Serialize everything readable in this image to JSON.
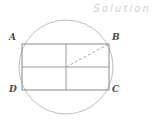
{
  "figure": {
    "watermark": "Solution",
    "canvas": {
      "width": 155,
      "height": 122,
      "background": "#ffffff"
    },
    "colors": {
      "stroke": "#8a8a8a",
      "stroke_light": "#b4b4b4",
      "circle": "#bfbfbf",
      "dashed": "#b0b0b0",
      "label": "#4a4a4a",
      "watermark": "#cfcfcf"
    },
    "circle": {
      "name": "circumscribed-circle",
      "cx": 66,
      "cy": 67,
      "r": 47
    },
    "rectangle": {
      "name": "inscribed-rectangle",
      "x": 22,
      "y": 44,
      "width": 87,
      "height": 46
    },
    "midlines": {
      "vertical_x": 66,
      "horizontal_y": 67
    },
    "diagonal": {
      "name": "center-to-B-radius",
      "style": "dashed",
      "x1": 66,
      "y1": 67,
      "x2": 109,
      "y2": 44
    },
    "vertices": [
      {
        "id": "A",
        "label": "A",
        "x": 22,
        "y": 44
      },
      {
        "id": "B",
        "label": "B",
        "x": 109,
        "y": 44
      },
      {
        "id": "C",
        "label": "C",
        "x": 109,
        "y": 90
      },
      {
        "id": "D",
        "label": "D",
        "x": 22,
        "y": 90
      }
    ]
  }
}
